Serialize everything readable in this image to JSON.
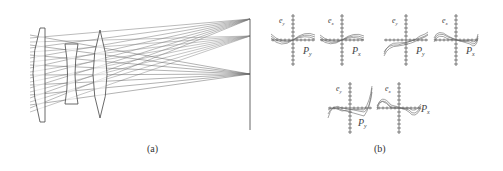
{
  "figure": {
    "panel_a": {
      "caption": "(a)",
      "description": "Optical lens system ray trace",
      "elements": [
        "meniscus-lens-1",
        "concave-lens-2",
        "biconvex-lens-3",
        "image-plane"
      ],
      "ray_bundles": 3
    },
    "panel_b": {
      "caption": "(b)",
      "plots": [
        {
          "ylabel": "e_y",
          "xlabel": "P_y",
          "ysub": "y",
          "xsub": "y"
        },
        {
          "ylabel": "e_x",
          "xlabel": "P_x",
          "ysub": "x",
          "xsub": "x"
        },
        {
          "ylabel": "e_y",
          "xlabel": "P_y",
          "ysub": "y",
          "xsub": "y"
        },
        {
          "ylabel": "e_x",
          "xlabel": "P_x",
          "ysub": "x",
          "xsub": "x"
        },
        {
          "ylabel": "e_y",
          "xlabel": "P_y",
          "ysub": "y",
          "xsub": "y"
        },
        {
          "ylabel": "e_x",
          "xlabel": "P_x",
          "ysub": "x",
          "xsub": "x"
        }
      ]
    },
    "labels": {
      "e": "e",
      "P": "P",
      "y": "y",
      "x": "x"
    },
    "colors": {
      "line": "#555555",
      "ray": "#666666",
      "axis": "#444444"
    }
  }
}
